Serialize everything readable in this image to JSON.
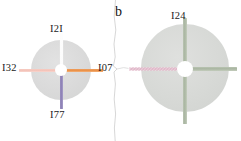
{
  "figure": {
    "title": "",
    "panels": [
      {
        "id": "panel-a",
        "letter": "",
        "disc": {
          "shape": "circle",
          "fill_color": "#dadada"
        },
        "hub": {
          "shape": "circle",
          "fill_color": "#ffffff"
        },
        "arms": [
          {
            "direction": "up",
            "label": "I2I",
            "color": "#fbfbfb",
            "style": "solid"
          },
          {
            "direction": "right",
            "label": "I07",
            "color": "#ea8f45",
            "style": "solid"
          },
          {
            "direction": "down",
            "label": "I77",
            "color": "#8d81b5",
            "style": "solid"
          },
          {
            "direction": "left",
            "label": "I32",
            "color": "#f3c2b7",
            "style": "solid"
          }
        ]
      },
      {
        "id": "panel-b",
        "letter": "b",
        "disc": {
          "shape": "circle",
          "fill_color": "#d7d9d6"
        },
        "hub": {
          "shape": "circle",
          "fill_color": "#ffffff"
        },
        "arms": [
          {
            "direction": "up",
            "label": "I24",
            "color": "#a9b5a1",
            "style": "solid"
          },
          {
            "direction": "right",
            "label": "",
            "color": "#a9b5a1",
            "style": "solid"
          },
          {
            "direction": "down",
            "label": "",
            "color": "#a9b5a1",
            "style": "solid"
          },
          {
            "direction": "left",
            "label": "",
            "color": "#d79fb4",
            "style": "hatched"
          }
        ]
      }
    ],
    "colors": {
      "disc_gray": "#dadada",
      "disc_gray_green": "#d7d9d6",
      "hub_white": "#ffffff",
      "arm_orange": "#ea8f45",
      "arm_pink": "#f3c2b7",
      "arm_purple": "#8d81b5",
      "arm_white": "#fbfbfb",
      "arm_sage": "#a9b5a1",
      "arm_magenta": "#d79fb4",
      "text": "#1b1b1b",
      "background": "#ffffff"
    },
    "seam": {
      "name": "torn-paper-divider",
      "color": "#cfcfcf"
    }
  }
}
